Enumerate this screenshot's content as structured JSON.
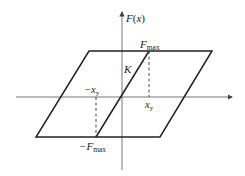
{
  "diagram": {
    "type": "hysteresis-loop",
    "axes": {
      "y_label": "F(x)",
      "y_label_main": "F",
      "y_label_arg": "(x)"
    },
    "labels": {
      "f_max_main": "F",
      "f_max_sub": "max",
      "neg_f_max_main": "−F",
      "neg_f_max_sub": "max",
      "x_y_main": "x",
      "x_y_sub": "y",
      "neg_x_y_main": "−x",
      "neg_x_y_sub": "y",
      "stiffness": "K"
    },
    "colors": {
      "line": "#222222",
      "axis": "#555555"
    }
  }
}
